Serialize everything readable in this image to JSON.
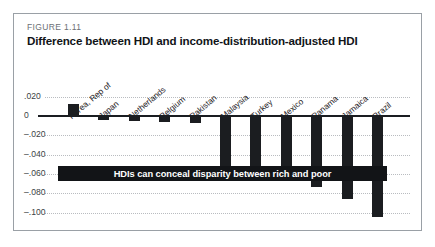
{
  "figure": {
    "number": "FIGURE 1.11",
    "title": "Difference between HDI and income-distribution-adjusted HDI"
  },
  "annotation": {
    "banner_text": "HDIs can conceal disparity between rich and poor"
  },
  "colors": {
    "bar": "#1b1d20",
    "banner_background": "#121417",
    "banner_text": "#ffffff",
    "axis": "#1a1d21",
    "gridline": "#b9bcc0",
    "border": "#9aa0a6"
  },
  "chart_data": {
    "type": "bar",
    "title": "Difference between HDI and income-distribution-adjusted HDI",
    "xlabel": "",
    "ylabel": "",
    "ylim": [
      -0.11,
      0.026
    ],
    "grid": true,
    "legend": "none",
    "tick_labels": [
      ".020",
      "0",
      "–.020",
      "–.040",
      "–.060",
      "–.080",
      "–.100"
    ],
    "ticks": [
      0.02,
      0,
      -0.02,
      -0.04,
      -0.06,
      -0.08,
      -0.1
    ],
    "categories": [
      "Korea, Rep of",
      "Japan",
      "Netherlands",
      "Belgium",
      "Pakistan",
      "Malaysia",
      "Turkey",
      "Mexico",
      "Panama",
      "Jamaica",
      "Brazil"
    ],
    "values": [
      0.012,
      -0.004,
      -0.005,
      -0.006,
      -0.007,
      -0.055,
      -0.053,
      -0.054,
      -0.074,
      -0.086,
      -0.105
    ]
  }
}
